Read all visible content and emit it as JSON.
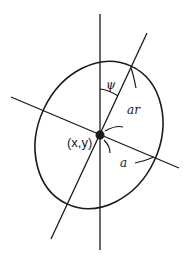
{
  "diagram": {
    "labels": {
      "center": "(x,y)",
      "angle": "ψ",
      "major_axis": "ar",
      "minor_axis": "a"
    },
    "colors": {
      "stroke": "#1a1a1a",
      "background": "#ffffff"
    }
  }
}
